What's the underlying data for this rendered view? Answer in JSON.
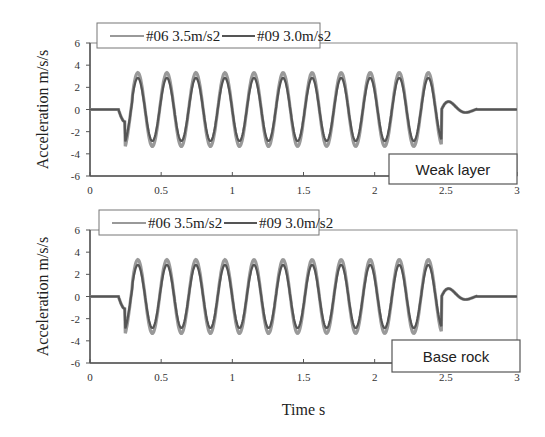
{
  "chart_data": [
    {
      "type": "line",
      "title": "",
      "annotation": "Weak layer",
      "xlabel": "",
      "ylabel": "Acceleration m/s/s",
      "xlim": [
        0,
        3
      ],
      "ylim": [
        -6,
        6
      ],
      "xticks": [
        "0",
        "0.5",
        "1",
        "1.5",
        "2",
        "2.5",
        "3"
      ],
      "yticks": [
        "6",
        "4",
        "2",
        "0",
        "-2",
        "-4",
        "-6"
      ],
      "legend_position": "top",
      "series": [
        {
          "name": "#06 3.5m/s2",
          "color": "#999999",
          "amplitude": 3.5,
          "description": "sinusoidal burst ~5 Hz from 0.25s to 2.5s"
        },
        {
          "name": "#09 3.0m/s2",
          "color": "#555555",
          "amplitude": 3.0,
          "description": "sinusoidal burst ~5 Hz from 0.25s to 2.5s"
        }
      ]
    },
    {
      "type": "line",
      "title": "",
      "annotation": "Base rock",
      "xlabel": "Time s",
      "ylabel": "Acceleration m/s/s",
      "xlim": [
        0,
        3
      ],
      "ylim": [
        -6,
        6
      ],
      "xticks": [
        "0",
        "0.5",
        "1",
        "1.5",
        "2",
        "2.5",
        "3"
      ],
      "yticks": [
        "6",
        "4",
        "2",
        "0",
        "-2",
        "-4",
        "-6"
      ],
      "legend_position": "top",
      "series": [
        {
          "name": "#06 3.5m/s2",
          "color": "#999999",
          "amplitude": 3.5,
          "description": "sinusoidal burst ~5 Hz from 0.25s to 2.5s"
        },
        {
          "name": "#09 3.0m/s2",
          "color": "#555555",
          "amplitude": 3.0,
          "description": "sinusoidal burst ~5 Hz from 0.25s to 2.5s"
        }
      ]
    }
  ],
  "labels": {
    "ylabel": "Acceleration m/s/s",
    "xlabel": "Time s",
    "top_annotation": "Weak layer",
    "bottom_annotation": "Base rock",
    "legend_06": "#06 3.5m/s2",
    "legend_09": "#09 3.0m/s2"
  }
}
